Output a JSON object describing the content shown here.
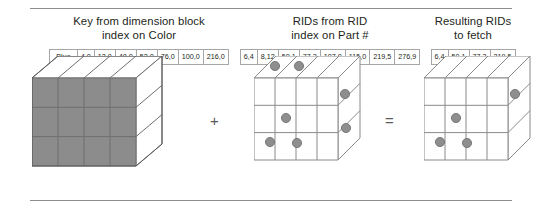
{
  "figure": {
    "separator_color": "#8d8d8d",
    "shaded_color": "#8c8c8c",
    "dot_color": "#8e8e8e",
    "line_color": "#6f6f6f"
  },
  "columns": [
    {
      "id": "key-from-dimension-block",
      "heading_line1": "Key from dimension block",
      "heading_line2": "index on Color",
      "cells": [
        "Blue",
        "4,0",
        "12,0",
        "48,0",
        "52,0",
        "76,0",
        "100,0",
        "216,0"
      ],
      "cube": {
        "shaded": true,
        "dots": []
      }
    },
    {
      "id": "rids-from-rid-index",
      "heading_line1": "RIDs from RID",
      "heading_line2": "index on Part #",
      "cells": [
        "6,4",
        "8,12",
        "50,1",
        "77,3",
        "107,0",
        "115,0",
        "219,5",
        "276,9"
      ],
      "cube": {
        "shaded": false,
        "dots": [
          "top-a",
          "top-b",
          "right-upper",
          "front-mid",
          "front-low-a",
          "front-low-b",
          "right-lower"
        ]
      }
    },
    {
      "id": "resulting-rids-to-fetch",
      "heading_line1": "Resulting RIDs",
      "heading_line2": "to fetch",
      "cells": [
        "6,4",
        "50,1",
        "77,3",
        "219,5"
      ],
      "cube": {
        "shaded": false,
        "dots": [
          "right-upper",
          "front-mid",
          "front-low-a",
          "front-low-b"
        ]
      }
    }
  ],
  "operators": {
    "plus": "+",
    "equals": "="
  }
}
